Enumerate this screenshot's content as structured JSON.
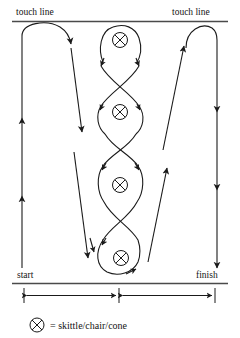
{
  "diagram": {
    "labels": {
      "touch_line_left": "touch line",
      "touch_line_right": "touch line",
      "start": "start",
      "finish": "finish"
    },
    "legend": {
      "symbol_name": "cone-symbol-icon",
      "equals": "=",
      "text": "skittle/chair/cone",
      "full_text": "= skittle/chair/cone"
    },
    "cones": [
      {
        "name": "cone-1",
        "x": 120,
        "y": 40
      },
      {
        "name": "cone-2",
        "x": 120,
        "y": 112
      },
      {
        "name": "cone-3",
        "x": 120,
        "y": 185
      },
      {
        "name": "cone-4",
        "x": 121,
        "y": 258
      }
    ],
    "colors": {
      "ink": "#1a1a1a",
      "rule": "#4a4a4a",
      "background": "#ffffff"
    },
    "dimensions": {
      "left_segment": "",
      "right_segment": ""
    }
  }
}
